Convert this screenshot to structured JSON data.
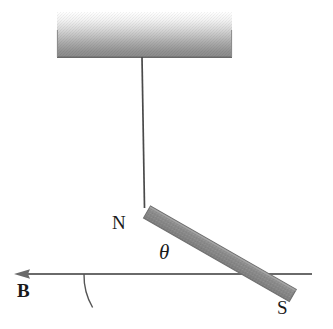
{
  "figure": {
    "background_color": "#ffffff"
  },
  "labels": {
    "north_pole": "N",
    "south_pole": "S",
    "angle": "θ",
    "field": "B"
  },
  "elements": {
    "ceiling": {
      "name": "ceiling-support-block",
      "x": 57,
      "y": 12,
      "width": 175,
      "height": 45,
      "fill_top": "#fdfdfd",
      "fill_bottom": "#8e8e8e",
      "border_color": "#6f6f6f"
    },
    "string": {
      "name": "suspension-string",
      "x1": 142,
      "y1": 57,
      "x2": 144,
      "y2": 207,
      "color": "#4a4a4a",
      "width": 1.6
    },
    "magnet": {
      "name": "bar-magnet",
      "x1": 147,
      "y1": 209,
      "x2": 292,
      "y2": 292,
      "thickness": 14,
      "fill": "#8d8d8d",
      "edge_color": "#6a6a6a",
      "angle_degrees": 30
    },
    "field_line": {
      "name": "magnetic-field-arrow",
      "x_start": 312,
      "x_end": 14,
      "y": 274,
      "color": "#6a6a6a",
      "width": 2,
      "arrow_direction": "left"
    },
    "angle_arc": {
      "name": "angle-arc",
      "vertex_x": 148,
      "vertex_y": 274,
      "radius": 64,
      "color": "#555555",
      "width": 1.4
    }
  },
  "colors": {
    "ink": "#1a1a1a",
    "magnet_gray": "#8d8d8d",
    "line_gray": "#6a6a6a",
    "ceiling_gray": "#8e8e8e"
  }
}
